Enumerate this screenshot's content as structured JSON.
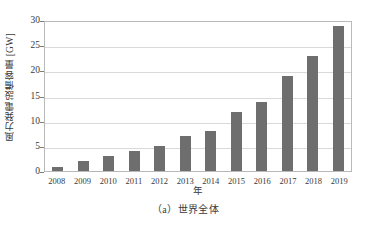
{
  "chart_data": {
    "type": "bar",
    "title": "",
    "subtitle": "",
    "xlabel": "年",
    "ylabel": "風力発電設備容量 [GW]",
    "categories": [
      "2008",
      "2009",
      "2010",
      "2011",
      "2012",
      "2013",
      "2014",
      "2015",
      "2016",
      "2017",
      "2018",
      "2019"
    ],
    "values": [
      0.8,
      1.9,
      2.9,
      3.9,
      4.9,
      6.9,
      7.9,
      11.8,
      13.8,
      18.9,
      22.9,
      28.8
    ],
    "series": [
      {
        "name": "風力発電設備容量",
        "values": [
          0.8,
          1.9,
          2.9,
          3.9,
          4.9,
          6.9,
          7.9,
          11.8,
          13.8,
          18.9,
          22.9,
          28.8
        ]
      }
    ],
    "ylim": [
      0,
      30
    ],
    "yticks": [
      0,
      5,
      10,
      15,
      20,
      25,
      30
    ],
    "ytick_labels": [
      "0",
      "5",
      "10",
      "15",
      "20",
      "25",
      "30"
    ],
    "grid": true,
    "grid_axis": "y",
    "legend": false,
    "legend_position": "none",
    "bar_color": "#6e6e6e",
    "gridline_color": "#d9d9d9",
    "axis_color": "#b9b9b9",
    "background_color": "#ffffff"
  },
  "caption": {
    "text": "（a）世界全体"
  }
}
